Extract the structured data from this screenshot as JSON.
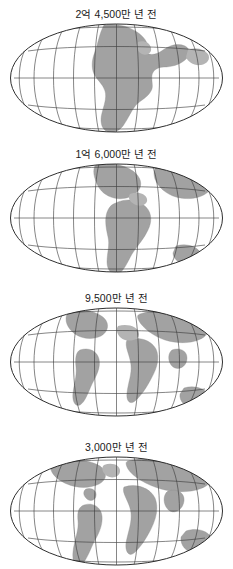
{
  "figure": {
    "kind": "continental-drift-sequence",
    "projection": "mollweide-oval",
    "panel_count": 4,
    "colors": {
      "background": "#ffffff",
      "land": "#a2a2a2",
      "graticule": "#3a3a3a",
      "outline": "#242424",
      "caption_text": "#1b1b1b"
    },
    "graticule": {
      "meridian_count": 13,
      "parallel_count": 5,
      "spacing_deg": 30
    }
  },
  "panels": [
    {
      "caption": "2억 4,500만 년 전",
      "stage": "pangaea",
      "land_note": "single supercontinent centered on map"
    },
    {
      "caption": "1억 6,000만 년 전",
      "stage": "early-rifting",
      "land_note": "supercontinent beginning to split, narrow seaway opening"
    },
    {
      "caption": "9,500만 년 전",
      "stage": "mid-separation",
      "land_note": "continents clearly separated, widening ocean basins"
    },
    {
      "caption": "3,000만 년 전",
      "stage": "near-modern",
      "land_note": "recognizable modern continental arrangement"
    }
  ]
}
